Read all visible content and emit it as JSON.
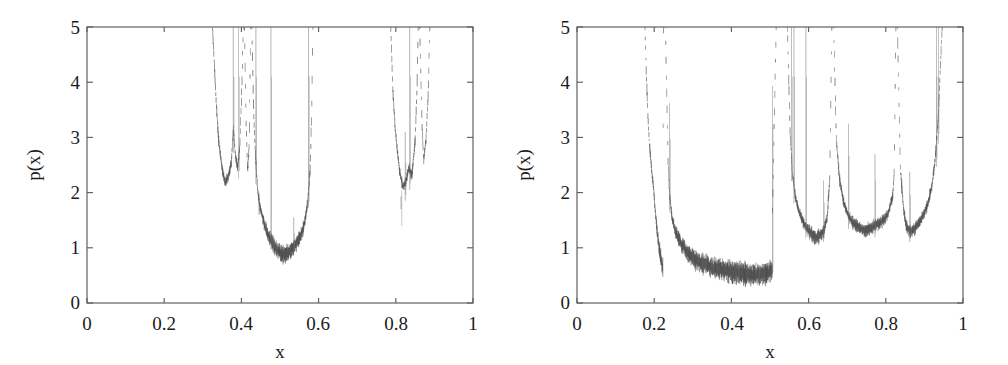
{
  "figure": {
    "background_color": "#ffffff",
    "ink_color": "#3a3a3a",
    "axis_color": "#5a5a5a",
    "panel_count": 2
  },
  "chart_data": [
    {
      "panel": "left",
      "type": "line",
      "title": "",
      "subtitle": "",
      "xlabel": "x",
      "ylabel": "p(x)",
      "xlim": [
        0,
        1
      ],
      "ylim": [
        0,
        5
      ],
      "xticks": [
        0,
        0.2,
        0.4,
        0.6,
        0.8,
        1
      ],
      "xticklabels": [
        "0",
        "0.2",
        "0.4",
        "0.6",
        "0.8",
        "1"
      ],
      "yticks": [
        0,
        1,
        2,
        3,
        4,
        5
      ],
      "yticklabels": [
        "0",
        "1",
        "2",
        "3",
        "4",
        "5"
      ],
      "grid": false,
      "legend": "none",
      "description": "Invariant density p(x) of a chaotic map supported on several disjoint bands; density diverges at band edges and is zero between bands.",
      "support_bands": [
        {
          "name": "band-1",
          "x_start": 0.325,
          "x_end": 0.405,
          "min_value": 2.1,
          "min_at_x": 0.358
        },
        {
          "name": "band-2",
          "x_start": 0.408,
          "x_end": 0.424,
          "min_value": 2.4,
          "min_at_x": 0.416
        },
        {
          "name": "band-3",
          "x_start": 0.427,
          "x_end": 0.585,
          "min_value": 0.88,
          "min_at_x": 0.512
        },
        {
          "name": "band-4",
          "x_start": 0.787,
          "x_end": 0.858,
          "min_value": 2.05,
          "min_at_x": 0.818
        },
        {
          "name": "band-5",
          "x_start": 0.862,
          "x_end": 0.888,
          "min_value": 2.6,
          "min_at_x": 0.872
        }
      ],
      "interior_spikes": [
        {
          "x": 0.379,
          "height": 5.0
        },
        {
          "x": 0.393,
          "height": 5.0
        },
        {
          "x": 0.4375,
          "height": 5.0
        },
        {
          "x": 0.4765,
          "height": 5.0
        },
        {
          "x": 0.574,
          "height": 5.0
        },
        {
          "x": 0.4455,
          "height": 2.0
        },
        {
          "x": 0.5355,
          "height": 1.55
        },
        {
          "x": 0.836,
          "height": 5.0
        },
        {
          "x": 0.8245,
          "height": 3.1
        },
        {
          "x": 0.8135,
          "height": 1.7
        }
      ],
      "series": [
        {
          "name": "p(x)",
          "x": [
            0.325,
            0.33,
            0.335,
            0.34,
            0.345,
            0.35,
            0.358,
            0.366,
            0.374,
            0.379,
            0.384,
            0.39,
            0.396,
            0.401,
            0.405,
            0.408,
            0.412,
            0.416,
            0.42,
            0.424,
            0.427,
            0.432,
            0.437,
            0.442,
            0.448,
            0.455,
            0.462,
            0.47,
            0.478,
            0.486,
            0.494,
            0.503,
            0.512,
            0.521,
            0.53,
            0.539,
            0.548,
            0.557,
            0.565,
            0.572,
            0.578,
            0.582,
            0.585,
            0.787,
            0.792,
            0.798,
            0.804,
            0.81,
            0.818,
            0.826,
            0.834,
            0.842,
            0.85,
            0.855,
            0.858,
            0.862,
            0.868,
            0.872,
            0.878,
            0.884,
            0.888
          ],
          "values": [
            5.0,
            4.3,
            3.6,
            3.05,
            2.7,
            2.45,
            2.18,
            2.3,
            2.55,
            3.2,
            2.7,
            2.45,
            2.85,
            3.9,
            5.0,
            5.0,
            3.3,
            2.4,
            2.85,
            5.0,
            5.0,
            3.4,
            2.6,
            2.05,
            1.75,
            1.55,
            1.38,
            1.22,
            1.12,
            1.02,
            0.96,
            0.9,
            0.88,
            0.92,
            0.98,
            1.05,
            1.14,
            1.28,
            1.5,
            1.85,
            2.4,
            3.4,
            5.0,
            5.0,
            3.9,
            3.2,
            2.75,
            2.4,
            2.1,
            2.2,
            2.45,
            2.3,
            2.95,
            3.9,
            5.0,
            5.0,
            3.2,
            2.6,
            2.95,
            3.8,
            5.0
          ]
        }
      ]
    },
    {
      "panel": "right",
      "type": "line",
      "title": "",
      "subtitle": "",
      "xlabel": "x",
      "ylabel": "p(x)",
      "xlim": [
        0,
        1
      ],
      "ylim": [
        0,
        5
      ],
      "xticks": [
        0,
        0.2,
        0.4,
        0.6,
        0.8,
        1
      ],
      "xticklabels": [
        "0",
        "0.2",
        "0.4",
        "0.6",
        "0.8",
        "1"
      ],
      "yticks": [
        0,
        1,
        2,
        3,
        4,
        5
      ],
      "yticklabels": [
        "0",
        "1",
        "2",
        "3",
        "4",
        "5"
      ],
      "grid": false,
      "legend": "none",
      "description": "Invariant density p(x) of a chaotic map on a merged band structure; sharp divergences at band edges and interior spikes from preimages of the critical point.",
      "support_bands": [
        {
          "name": "band-1",
          "x_start": 0.176,
          "x_end": 0.224,
          "min_value": 0.6,
          "min_at_x": 0.222
        },
        {
          "name": "band-2",
          "x_start": 0.229,
          "x_end": 0.516,
          "min_value": 0.52,
          "min_at_x": 0.455
        },
        {
          "name": "band-3",
          "x_start": 0.545,
          "x_end": 0.66,
          "min_value": 1.18,
          "min_at_x": 0.618
        },
        {
          "name": "band-4",
          "x_start": 0.665,
          "x_end": 0.826,
          "min_value": 1.32,
          "min_at_x": 0.745
        },
        {
          "name": "band-5",
          "x_start": 0.83,
          "x_end": 0.946,
          "min_value": 1.3,
          "min_at_x": 0.852
        }
      ],
      "interior_spikes": [
        {
          "x": 0.24,
          "height": 3.62
        },
        {
          "x": 0.506,
          "height": 3.93
        },
        {
          "x": 0.556,
          "height": 5.0
        },
        {
          "x": 0.562,
          "height": 5.0
        },
        {
          "x": 0.593,
          "height": 5.0
        },
        {
          "x": 0.639,
          "height": 2.22
        },
        {
          "x": 0.703,
          "height": 3.25
        },
        {
          "x": 0.772,
          "height": 2.7
        },
        {
          "x": 0.862,
          "height": 2.38
        },
        {
          "x": 0.931,
          "height": 5.0
        },
        {
          "x": 0.936,
          "height": 5.0
        }
      ],
      "series": [
        {
          "name": "p(x)",
          "x": [
            0.176,
            0.18,
            0.184,
            0.188,
            0.193,
            0.198,
            0.203,
            0.208,
            0.213,
            0.218,
            0.222,
            0.224,
            0.229,
            0.234,
            0.24,
            0.246,
            0.253,
            0.261,
            0.27,
            0.28,
            0.292,
            0.305,
            0.32,
            0.338,
            0.358,
            0.38,
            0.405,
            0.43,
            0.455,
            0.478,
            0.495,
            0.506,
            0.512,
            0.516,
            0.545,
            0.552,
            0.558,
            0.565,
            0.573,
            0.582,
            0.592,
            0.602,
            0.612,
            0.618,
            0.628,
            0.639,
            0.648,
            0.655,
            0.66,
            0.665,
            0.672,
            0.68,
            0.69,
            0.703,
            0.716,
            0.73,
            0.745,
            0.76,
            0.772,
            0.79,
            0.806,
            0.818,
            0.826,
            0.83,
            0.838,
            0.846,
            0.852,
            0.862,
            0.874,
            0.886,
            0.898,
            0.91,
            0.92,
            0.928,
            0.936,
            0.941,
            0.946
          ],
          "values": [
            5.0,
            4.1,
            3.35,
            2.85,
            2.45,
            2.1,
            1.65,
            1.28,
            1.0,
            0.78,
            0.63,
            0.6,
            5.0,
            2.85,
            1.95,
            1.55,
            1.35,
            1.2,
            1.08,
            0.98,
            0.88,
            0.8,
            0.74,
            0.68,
            0.63,
            0.6,
            0.57,
            0.54,
            0.52,
            0.53,
            0.56,
            0.62,
            0.72,
            0.6,
            5.0,
            3.1,
            2.35,
            1.95,
            1.7,
            1.52,
            1.4,
            1.3,
            1.22,
            1.18,
            1.22,
            1.3,
            1.55,
            2.3,
            5.0,
            5.0,
            2.95,
            2.25,
            1.85,
            1.58,
            1.45,
            1.38,
            1.32,
            1.35,
            1.4,
            1.48,
            1.62,
            1.95,
            2.85,
            5.0,
            2.4,
            1.7,
            1.42,
            1.3,
            1.35,
            1.45,
            1.6,
            1.82,
            2.15,
            2.6,
            3.4,
            4.2,
            5.0
          ]
        }
      ]
    }
  ],
  "panels": {
    "left": {
      "name": "left-plot",
      "xlabel": "x",
      "ylabel": "p(x)",
      "xticklabels": [
        "0",
        "0.2",
        "0.4",
        "0.6",
        "0.8",
        "1"
      ],
      "yticklabels": [
        "0",
        "1",
        "2",
        "3",
        "4",
        "5"
      ]
    },
    "right": {
      "name": "right-plot",
      "xlabel": "x",
      "ylabel": "p(x)",
      "xticklabels": [
        "0",
        "0.2",
        "0.4",
        "0.6",
        "0.8",
        "1"
      ],
      "yticklabels": [
        "0",
        "1",
        "2",
        "3",
        "4",
        "5"
      ]
    }
  }
}
